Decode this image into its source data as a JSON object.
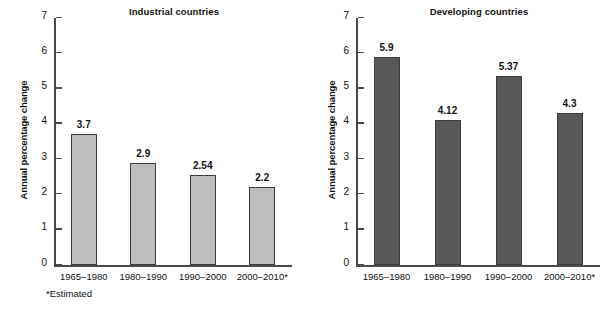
{
  "figure": {
    "footnote": "*Estimated",
    "bar_color_industrial": "#bdbdbd",
    "bar_color_developing": "#585858",
    "bar_edge_color": "#3d3d3d",
    "axis_color": "#4a4a4a"
  },
  "chart_data": [
    {
      "type": "bar",
      "title": "Industrial countries",
      "xlabel": "",
      "ylabel": "Annual percentage change",
      "categories": [
        "1965–1980",
        "1980–1990",
        "1990–2000",
        "2000–2010*"
      ],
      "values": [
        3.7,
        2.9,
        2.54,
        2.2
      ],
      "value_labels": [
        "3.7",
        "2.9",
        "2.54",
        "2.2"
      ],
      "ylim": [
        0,
        7
      ],
      "yticks": [
        0,
        1,
        2,
        3,
        4,
        5,
        6,
        7
      ],
      "ytick_labels": [
        "0",
        "1",
        "2",
        "3",
        "4",
        "5",
        "6",
        "7"
      ],
      "grid": false,
      "legend": "none",
      "bar_color": "#bdbdbd"
    },
    {
      "type": "bar",
      "title": "Developing countries",
      "xlabel": "",
      "ylabel": "Annual percentage change",
      "categories": [
        "1965–1980",
        "1980–1990",
        "1990–2000",
        "2000–2010*"
      ],
      "values": [
        5.9,
        4.12,
        5.37,
        4.3
      ],
      "value_labels": [
        "5.9",
        "4.12",
        "5.37",
        "4.3"
      ],
      "ylim": [
        0,
        7
      ],
      "yticks": [
        0,
        1,
        2,
        3,
        4,
        5,
        6,
        7
      ],
      "ytick_labels": [
        "0",
        "1",
        "2",
        "3",
        "4",
        "5",
        "6",
        "7"
      ],
      "grid": false,
      "legend": "none",
      "bar_color": "#585858"
    }
  ]
}
